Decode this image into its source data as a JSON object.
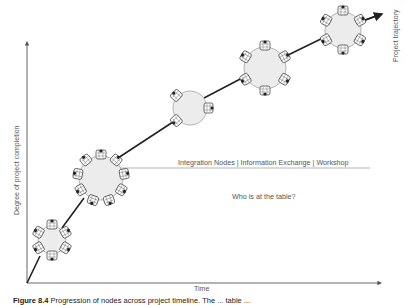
{
  "diagram": {
    "y_axis_label": "Degree of project completion",
    "x_axis_label": "Time",
    "trajectory_label": "Project trajectory",
    "node_types_line": "Integration Nodes | Information Exchange | Workshop",
    "question": "Who is at the table?",
    "caption_prefix": "Figure 8.4",
    "caption_text": "Progression of nodes across project timeline. The ... table ...",
    "colors": {
      "axis": "#555555",
      "trajectory": "#222222",
      "node_fill": "#ececec",
      "node_stroke": "#888888",
      "text": "#555555"
    },
    "nodes": [
      {
        "name": "node-1",
        "cx": 52,
        "cy": 240,
        "r": 14,
        "seats": 6
      },
      {
        "name": "node-2",
        "cx": 101,
        "cy": 178,
        "r": 22,
        "seats": 9
      },
      {
        "name": "node-3",
        "cx": 190,
        "cy": 108,
        "r": 17,
        "seats": 3
      },
      {
        "name": "node-4",
        "cx": 265,
        "cy": 68,
        "r": 21,
        "seats": 6
      },
      {
        "name": "node-5",
        "cx": 343,
        "cy": 30,
        "r": 18,
        "seats": 6
      }
    ]
  }
}
